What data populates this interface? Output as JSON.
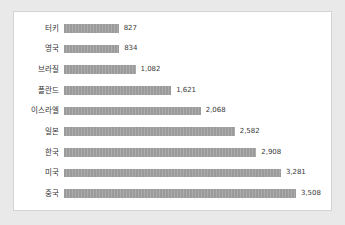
{
  "chart_data": {
    "type": "bar",
    "orientation": "horizontal",
    "title": "",
    "subtitle": "",
    "xlabel": "",
    "ylabel": "",
    "grid": false,
    "legend": null,
    "axis_visible": false,
    "tick_labels_visible": false,
    "data_labels_visible": true,
    "xlim": [
      0,
      3508
    ],
    "categories": [
      "터키",
      "영국",
      "브라질",
      "폴란드",
      "이스라엘",
      "일본",
      "한국",
      "미국",
      "중국"
    ],
    "values": [
      827,
      834,
      1082,
      1621,
      2068,
      2582,
      2908,
      3281,
      3508
    ],
    "value_labels": [
      "827",
      "834",
      "1,082",
      "1,621",
      "2,068",
      "2,582",
      "2,908",
      "3,281",
      "3,508"
    ],
    "bars": [
      {
        "category": "터키",
        "value": 827,
        "label": "827",
        "pct": 23.6
      },
      {
        "category": "영국",
        "value": 834,
        "label": "834",
        "pct": 23.8
      },
      {
        "category": "브라질",
        "value": 1082,
        "label": "1,082",
        "pct": 30.8
      },
      {
        "category": "폴란드",
        "value": 1621,
        "label": "1,621",
        "pct": 46.2
      },
      {
        "category": "이스라엘",
        "value": 2068,
        "label": "2,068",
        "pct": 58.9
      },
      {
        "category": "일본",
        "value": 2582,
        "label": "2,582",
        "pct": 73.6
      },
      {
        "category": "한국",
        "value": 2908,
        "label": "2,908",
        "pct": 82.9
      },
      {
        "category": "미국",
        "value": 3281,
        "label": "3,281",
        "pct": 93.5
      },
      {
        "category": "중국",
        "value": 3508,
        "label": "3,508",
        "pct": 100.0
      }
    ]
  },
  "colors": {
    "bar": "#9b9b9b",
    "panel_background": "#ffffff",
    "panel_border": "#d4d4d4",
    "page_background": "#e9e9e9",
    "category_text": "#333333",
    "value_text": "#3a3a3a"
  }
}
